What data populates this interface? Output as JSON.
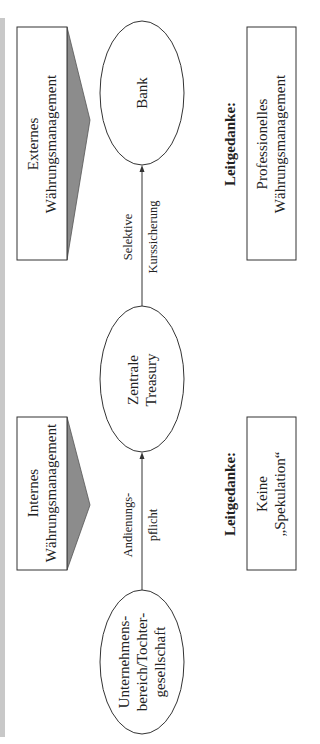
{
  "diagram": {
    "nodes": {
      "bank": {
        "label": "Bank"
      },
      "treasury": {
        "line1": "Zentrale",
        "line2": "Treasury"
      },
      "subsidiary": {
        "line1": "Unternehmens-",
        "line2": "bereich/Tochter-",
        "line3": "gesellschaft"
      }
    },
    "edges": {
      "subsidiary_to_treasury": {
        "line1": "Andienungs-",
        "line2": "pflicht"
      },
      "treasury_to_bank": {
        "line1": "Selektive",
        "line2": "Kurssicherung"
      }
    },
    "scope_boxes": {
      "external": {
        "line1": "Externes",
        "line2": "Währungsmanagement"
      },
      "internal": {
        "line1": "Internes",
        "line2": "Währungsmanagement"
      }
    },
    "principles": {
      "external": {
        "heading": "Leitgedanke:",
        "line1": "Professionelles",
        "line2": "Währungsmanagement"
      },
      "internal": {
        "heading": "Leitgedanke:",
        "line1": "Keine",
        "line2": "„Spekulation“"
      }
    },
    "colors": {
      "stroke": "#333333",
      "arrow_fill": "#8c8c8c",
      "side_bar": "#c8c8c8"
    }
  }
}
